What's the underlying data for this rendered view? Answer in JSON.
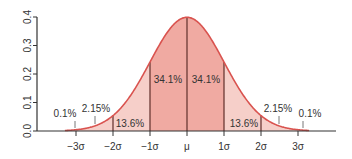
{
  "chart_data": {
    "type": "area",
    "title": "",
    "xlabel": "",
    "ylabel": "",
    "ylim": [
      0.0,
      0.4
    ],
    "xlim": [
      -3.5,
      4.0
    ],
    "grid": false,
    "y_ticks": [
      "0.0",
      "0.1",
      "0.2",
      "0.3",
      "0.4"
    ],
    "y_tick_values": [
      0.0,
      0.1,
      0.2,
      0.3,
      0.4
    ],
    "x_ticks": [
      "−3σ",
      "−2σ",
      "−1σ",
      "μ",
      "1σ",
      "2σ",
      "3σ"
    ],
    "x_tick_values": [
      -3,
      -2,
      -1,
      0,
      1,
      2,
      3
    ],
    "curve": "standard normal density",
    "regions": [
      {
        "from": -4,
        "to": -3,
        "label": "0.1%",
        "value": 0.1
      },
      {
        "from": -3,
        "to": -2,
        "label": "2.15%",
        "value": 2.15
      },
      {
        "from": -2,
        "to": -1,
        "label": "13.6%",
        "value": 13.6
      },
      {
        "from": -1,
        "to": 0,
        "label": "34.1%",
        "value": 34.1
      },
      {
        "from": 0,
        "to": 1,
        "label": "34.1%",
        "value": 34.1
      },
      {
        "from": 1,
        "to": 2,
        "label": "13.6%",
        "value": 13.6
      },
      {
        "from": 2,
        "to": 3,
        "label": "2.15%",
        "value": 2.15
      },
      {
        "from": 3,
        "to": 4,
        "label": "0.1%",
        "value": 0.1
      }
    ],
    "colors": {
      "curve": "#d9534f",
      "fill_inner": "#f0aaa2",
      "fill_outer": "#f6cfc9",
      "divider": "#6b3a35",
      "axis": "#333333"
    }
  }
}
